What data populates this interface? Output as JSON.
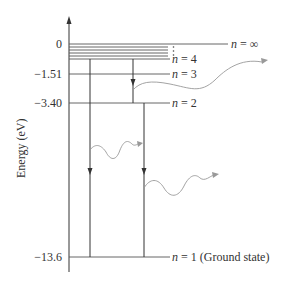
{
  "diagram": {
    "y_axis_label": "Energy (eV)",
    "levels": [
      {
        "n": "∞",
        "label_n": "n",
        "label_rest": " =  ∞",
        "energy": "0",
        "y": 44
      },
      {
        "n": "4",
        "label_n": "n",
        "label_rest": " = 4",
        "energy": "",
        "y": 59
      },
      {
        "n": "3",
        "label_n": "n",
        "label_rest": " = 3",
        "energy": "-1.51",
        "y": 74
      },
      {
        "n": "2",
        "label_n": "n",
        "label_rest": " = 2",
        "energy": "-3.40",
        "y": 103
      },
      {
        "n": "1",
        "label_n": "n",
        "label_rest": " = 1 (Ground state)",
        "energy": "-13.6",
        "y": 257
      }
    ],
    "tick_labels": [
      "0",
      "−1.51",
      "−3.40",
      "−13.6"
    ],
    "transitions": [
      {
        "from": "n=4",
        "to": "n=3",
        "photon": "emitted"
      },
      {
        "from": "n=4",
        "to": "n=1",
        "photon": "emitted"
      },
      {
        "from": "n=2",
        "to": "n=1",
        "photon": "emitted"
      }
    ],
    "colors": {
      "lines": "#333333",
      "photon": "#999999"
    }
  }
}
